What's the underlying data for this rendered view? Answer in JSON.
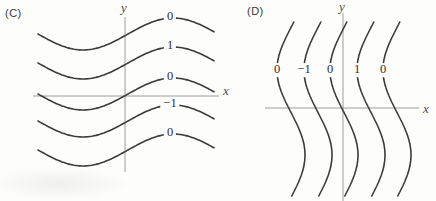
{
  "figure": {
    "type": "contour-level-curves",
    "background_color": "#fdfdfc",
    "curve_color": "#3c3c3c",
    "axis_color": "#9c9c9c",
    "label_color": "#2e2e2e"
  },
  "panels": [
    {
      "panel_label": "(C)",
      "x_axis_label": "x",
      "y_axis_label": "y",
      "wave_orientation": "horizontal",
      "contour_labels": [
        "0",
        "1",
        "0",
        "−1",
        "0"
      ]
    },
    {
      "panel_label": "(D)",
      "x_axis_label": "x",
      "y_axis_label": "y",
      "wave_orientation": "vertical",
      "contour_labels": [
        "0",
        "−1",
        "0",
        "1",
        "0"
      ]
    }
  ]
}
